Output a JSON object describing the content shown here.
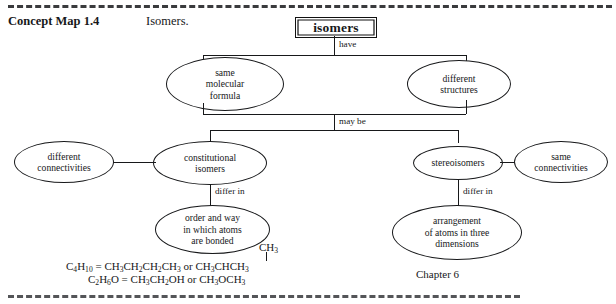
{
  "page": {
    "header_label": "Concept Map 1.4",
    "header_title": "Isomers.",
    "chapter_note": "Chapter 6"
  },
  "diagram": {
    "root": {
      "label": "isomers"
    },
    "links": {
      "have": "have",
      "may_be": "may be",
      "differ_in_left": "differ in",
      "differ_in_right": "differ in"
    },
    "nodes": {
      "same_molecular_formula": "same molecular formula",
      "different_structures": "different structures",
      "constitutional_isomers": "constitutional isomers",
      "stereoisomers": "stereoisomers",
      "different_connectivities": "different connectivities",
      "same_connectivities": "same connectivities",
      "order_and_way": "order and way in which atoms are bonded",
      "arrangement_three_dimensions": "arrangement of atoms in three dimensions"
    },
    "node_lines": {
      "same_molecular_formula": [
        "same",
        "molecular",
        "formula"
      ],
      "different_structures": [
        "different",
        "structures"
      ],
      "constitutional_isomers": [
        "constitutional",
        "isomers"
      ],
      "stereoisomers": [
        "stereoisomers"
      ],
      "different_connectivities": [
        "different",
        "connectivities"
      ],
      "same_connectivities": [
        "same",
        "connectivities"
      ],
      "order_and_way": [
        "order and way",
        "in which atoms",
        "are bonded"
      ],
      "arrangement_three_dimensions": [
        "arrangement",
        "of atoms in three",
        "dimensions"
      ]
    }
  },
  "examples": {
    "branch_group": "CH3",
    "line1": {
      "formula": "C4H10",
      "equals": "=",
      "structure_a": "CH3CH2CH2CH3",
      "conjunction": "or",
      "structure_b": "CH3CHCH3"
    },
    "line2": {
      "formula": "C2H6O",
      "equals": "=",
      "structure_a": "CH3CH2OH",
      "conjunction": "or",
      "structure_b": "CH3OCH3"
    }
  },
  "colors": {
    "ink": "#17181a",
    "paper": "#ffffff"
  }
}
